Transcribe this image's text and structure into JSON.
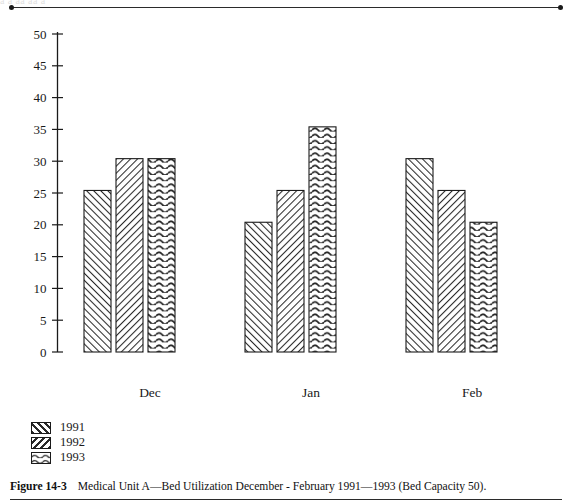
{
  "figure": {
    "number_label": "Figure 14-3",
    "caption_text": "Medical Unit A—Bed Utilization December - February 1991—1993 (Bed Capacity 50).",
    "ghost_text": "a        a              aa                                                  aa                            a"
  },
  "legend": {
    "position": "below-left",
    "items": [
      {
        "label": "1991",
        "pattern": "diagonal-up-hatch"
      },
      {
        "label": "1992",
        "pattern": "diagonal-down-hatch"
      },
      {
        "label": "1993",
        "pattern": "wavy-hatch"
      }
    ]
  },
  "chart_data": {
    "type": "bar",
    "title": "",
    "subtitle": "",
    "xlabel": "",
    "ylabel": "",
    "categories": [
      "Dec",
      "Jan",
      "Feb"
    ],
    "series": [
      {
        "name": "1991",
        "values": [
          25.4,
          20.4,
          30.4
        ]
      },
      {
        "name": "1992",
        "values": [
          30.4,
          25.4,
          25.4
        ]
      },
      {
        "name": "1993",
        "values": [
          30.4,
          35.4,
          20.4
        ]
      }
    ],
    "ylim": [
      0,
      50
    ],
    "ytick_values": [
      0,
      5,
      10,
      15,
      20,
      25,
      30,
      35,
      40,
      45,
      50
    ],
    "ytick_labels": [
      "0",
      "5",
      "10",
      "15",
      "20",
      "25",
      "30",
      "35",
      "40",
      "45",
      "50"
    ],
    "xtick_labels": [
      "Dec",
      "Jan",
      "Feb"
    ],
    "grid": false,
    "legend_position": "below-left",
    "axis_color": "#1a1a1a",
    "bar_edge_color": "#1a1a1a",
    "bar_fill_color": "#ffffff"
  }
}
